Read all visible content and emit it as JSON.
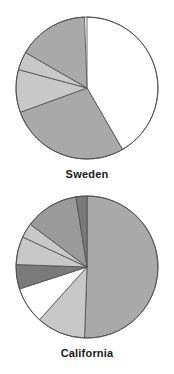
{
  "figure": {
    "background": "#ffffff",
    "charts": [
      {
        "caption": "Sweden",
        "chart_index": 0
      },
      {
        "caption": "California",
        "chart_index": 1
      }
    ]
  },
  "palette": {
    "white": "#ffffff",
    "light_gray": "#c8c8c8",
    "medium_gray": "#a9a9a9",
    "mid_gray": "#9a9a9a",
    "dark_gray": "#7a7a7a",
    "outline": "#4d4d4d",
    "text": "#1a1a1a"
  },
  "chart_data": [
    {
      "type": "pie",
      "title": "Sweden",
      "xlabel": "",
      "ylabel": "",
      "start_angle_deg": 0,
      "direction": "clockwise",
      "legend": "none",
      "grid": false,
      "categories": [
        "Slice 1",
        "Slice 2",
        "Slice 3",
        "Slice 4",
        "Slice 5"
      ],
      "values": [
        41.7,
        27.8,
        9.7,
        4.2,
        16.1
      ],
      "angles_deg": [
        150.0,
        100.0,
        35.0,
        15.0,
        58.0
      ],
      "colors": [
        "#ffffff",
        "#a9a9a9",
        "#c8c8c8",
        "#c8c8c8",
        "#a9a9a9"
      ]
    },
    {
      "type": "pie",
      "title": "California",
      "xlabel": "",
      "ylabel": "",
      "start_angle_deg": 0,
      "direction": "clockwise",
      "legend": "none",
      "grid": false,
      "categories": [
        "Slice 1",
        "Slice 2",
        "Slice 3",
        "Slice 4",
        "Slice 5",
        "Slice 6",
        "Slice 7",
        "Slice 8"
      ],
      "values": [
        50.6,
        11.1,
        8.3,
        5.6,
        6.4,
        3.3,
        12.2,
        2.5
      ],
      "angles_deg": [
        182.0,
        40.0,
        30.0,
        20.0,
        23.0,
        12.0,
        44.0,
        9.0
      ],
      "colors": [
        "#a9a9a9",
        "#c8c8c8",
        "#ffffff",
        "#7a7a7a",
        "#c8c8c8",
        "#c8c8c8",
        "#9a9a9a",
        "#7a7a7a"
      ]
    }
  ]
}
